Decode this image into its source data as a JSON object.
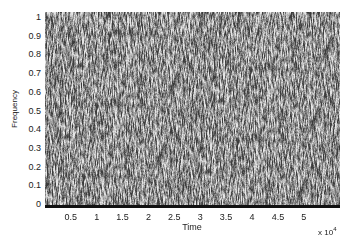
{
  "chart_data": {
    "type": "heatmap",
    "title": "",
    "xlabel": "Time",
    "ylabel": "Frequency",
    "x_multiplier": "x 10^4",
    "x_multiplier_base": "x 10",
    "x_multiplier_exp": "4",
    "xlim": [
      0,
      57000
    ],
    "ylim": [
      0,
      1
    ],
    "x_ticks": [
      "0.5",
      "1",
      "1.5",
      "2",
      "2.5",
      "3",
      "3.5",
      "4",
      "4.5",
      "5"
    ],
    "y_ticks": [
      "0",
      "0.1",
      "0.2",
      "0.3",
      "0.4",
      "0.5",
      "0.6",
      "0.7",
      "0.8",
      "0.9",
      "1"
    ],
    "colormap": "grayscale",
    "grid": false
  }
}
